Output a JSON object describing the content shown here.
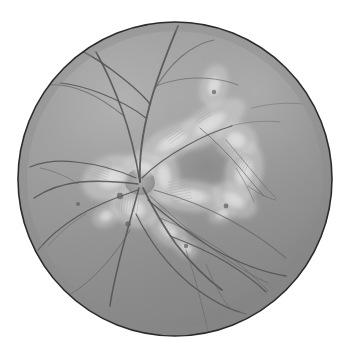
{
  "image": {
    "kind": "fundus-photograph",
    "modality": "Retinal fundus photograph (grayscale)",
    "title": "Retinal fundus photograph",
    "background_color": "#ffffff",
    "width": 349,
    "height": 354
  },
  "fundus": {
    "shape": "circle",
    "center_x": 175,
    "center_y": 179,
    "radius": 157,
    "rim_color": "#2b2b2b",
    "rim_width": 1.6,
    "base_color": "#a6a6a6",
    "highlight_color": "#c4c4c4",
    "shadow_color": "#8d8d8d"
  },
  "optic_disc": {
    "label": "optic-disc",
    "center_x": 140,
    "center_y": 182,
    "radius_x": 15,
    "radius_y": 13,
    "color": "#b0b0b0"
  },
  "vessel_style": {
    "color": "#5b5b5b",
    "color_fine": "#6e6e6e",
    "width_major": 1.7,
    "width_minor": 1.1,
    "width_fine": 0.7
  },
  "exudate_style": {
    "color": "#fbfbfb",
    "soft_color": "#ededed",
    "striation_color": "#bdbdbd"
  },
  "vessels": [
    {
      "name": "superior-temporal-arcade",
      "d": "M140,182 C139,160 143,130 150,104 C157,78 168,50 178,26",
      "w": 1.9
    },
    {
      "name": "superior-branch-a",
      "d": "M150,104 C143,95 128,82 112,70 C97,59 82,50 70,46",
      "w": 1.5
    },
    {
      "name": "superior-branch-b",
      "d": "M146,118 C136,110 118,100 100,93 C84,87 70,84 60,83",
      "w": 1.2
    },
    {
      "name": "superior-branch-c",
      "d": "M153,92 C160,80 170,66 182,56 C192,48 204,42 214,40",
      "w": 1.1
    },
    {
      "name": "superior-branch-d",
      "d": "M156,86 C166,82 182,78 198,78 C214,78 228,81 238,85",
      "w": 0.9
    },
    {
      "name": "superior-nasal-arcade",
      "d": "M140,182 C136,158 130,132 122,110 C114,88 104,66 96,52",
      "w": 1.6
    },
    {
      "name": "superior-nasal-branch",
      "d": "M124,116 C114,108 100,98 86,92 C72,86 58,84 48,85",
      "w": 1.1
    },
    {
      "name": "disc-upper-temporal",
      "d": "M142,178 C152,168 168,156 186,146 C202,137 218,130 232,126",
      "w": 1.2
    },
    {
      "name": "nasal-horizontal",
      "d": "M138,184 C122,182 100,180 80,182 C62,184 46,190 34,198",
      "w": 1.5
    },
    {
      "name": "nasal-upper",
      "d": "M136,178 C118,170 96,164 76,162 C58,160 42,162 30,167",
      "w": 1.2
    },
    {
      "name": "nasal-lower",
      "d": "M138,190 C120,196 98,204 78,216 C62,226 48,238 38,250",
      "w": 1.3
    },
    {
      "name": "inferior-nasal-arcade",
      "d": "M139,188 C134,206 128,228 122,250 C117,270 112,290 110,306",
      "w": 1.5
    },
    {
      "name": "inferior-nasal-branch",
      "d": "M130,230 C122,244 110,260 96,274 C84,286 72,294 62,298",
      "w": 1.0
    },
    {
      "name": "inferior-temporal-arcade",
      "d": "M143,188 C152,206 163,226 176,244 C190,262 206,278 222,290",
      "w": 1.7
    },
    {
      "name": "inferior-temporal-branch-a",
      "d": "M170,236 C186,242 206,250 226,262 C242,272 256,282 266,292",
      "w": 1.2
    },
    {
      "name": "inferior-temporal-branch-b",
      "d": "M160,218 C180,226 204,238 226,254 C244,267 258,280 268,291",
      "w": 0.9
    },
    {
      "name": "inferior-long-sweep",
      "d": "M148,200 C164,214 186,232 212,248 C236,262 262,272 286,276",
      "w": 1.4
    },
    {
      "name": "inferior-sweep-lower",
      "d": "M136,214 C148,238 166,264 190,284 C210,300 230,310 246,314",
      "w": 1.2
    },
    {
      "name": "temporal-mid-a",
      "d": "M154,190 C176,196 204,206 230,220 C252,232 272,246 286,258",
      "w": 1.1
    },
    {
      "name": "temporal-mid-b",
      "d": "M150,196 C168,212 190,232 214,250 C234,265 252,276 268,283",
      "w": 0.9
    },
    {
      "name": "inferior-fine-a",
      "d": "M186,250 C192,268 198,288 202,306 C205,318 207,326 208,332",
      "w": 0.8
    },
    {
      "name": "inferior-fine-b",
      "d": "M206,264 C212,280 220,296 230,308",
      "w": 0.7
    },
    {
      "name": "lesion-vessel-a",
      "d": "M200,128 C214,140 228,154 240,168 C250,180 258,190 264,196",
      "w": 1.0
    },
    {
      "name": "lesion-vessel-b",
      "d": "M226,140 C236,152 248,166 258,178 C266,188 272,194 276,198",
      "w": 0.8
    },
    {
      "name": "lesion-vessel-c",
      "d": "M236,168 C244,180 250,192 254,202",
      "w": 0.7
    },
    {
      "name": "lesion-vessel-d",
      "d": "M248,186 C256,192 266,198 276,200",
      "w": 0.7
    },
    {
      "name": "temporal-fine-upper",
      "d": "M230,126 C246,122 264,120 280,122",
      "w": 0.6
    },
    {
      "name": "far-temporal-fine",
      "d": "M252,108 C268,104 286,102 302,104",
      "w": 0.6
    },
    {
      "name": "nasal-fine-branch",
      "d": "M78,184 C66,176 52,170 40,168",
      "w": 0.7
    },
    {
      "name": "nasal-fine-lower",
      "d": "M86,214 C72,222 58,234 48,246",
      "w": 0.7
    }
  ],
  "exudates": [
    {
      "name": "exudate-peridisc-nasal",
      "cx": 112,
      "cy": 178,
      "rx": 20,
      "ry": 14,
      "rot": -20,
      "opacity": 0.92
    },
    {
      "name": "exudate-peridisc-inferior",
      "cx": 134,
      "cy": 208,
      "rx": 16,
      "ry": 12,
      "rot": 25,
      "opacity": 0.9
    },
    {
      "name": "exudate-disc-margin",
      "cx": 144,
      "cy": 168,
      "rx": 14,
      "ry": 10,
      "rot": 10,
      "opacity": 0.85
    },
    {
      "name": "exudate-band-superior",
      "cx": 172,
      "cy": 142,
      "rx": 24,
      "ry": 10,
      "rot": -28,
      "opacity": 0.88
    },
    {
      "name": "exudate-ring-upper",
      "cx": 210,
      "cy": 124,
      "rx": 26,
      "ry": 11,
      "rot": -32,
      "opacity": 0.9
    },
    {
      "name": "exudate-ring-upper-right",
      "cx": 236,
      "cy": 140,
      "rx": 14,
      "ry": 12,
      "rot": 20,
      "opacity": 0.88
    },
    {
      "name": "exudate-ring-right",
      "cx": 244,
      "cy": 172,
      "rx": 12,
      "ry": 20,
      "rot": 12,
      "opacity": 0.86
    },
    {
      "name": "exudate-ring-lower-right",
      "cx": 234,
      "cy": 200,
      "rx": 16,
      "ry": 10,
      "rot": 30,
      "opacity": 0.8
    },
    {
      "name": "exudate-ring-lower",
      "cx": 190,
      "cy": 196,
      "rx": 26,
      "ry": 10,
      "rot": 6,
      "opacity": 0.84
    },
    {
      "name": "exudate-ring-left",
      "cx": 164,
      "cy": 176,
      "rx": 10,
      "ry": 18,
      "rot": -6,
      "opacity": 0.8
    },
    {
      "name": "exudate-loop-superior",
      "cx": 214,
      "cy": 86,
      "rx": 9,
      "ry": 14,
      "rot": 14,
      "opacity": 0.82
    },
    {
      "name": "exudate-inferior-tail",
      "cx": 168,
      "cy": 230,
      "rx": 14,
      "ry": 9,
      "rot": 40,
      "opacity": 0.78
    },
    {
      "name": "exudate-inferior-spot",
      "cx": 186,
      "cy": 248,
      "rx": 8,
      "ry": 6,
      "rot": 35,
      "opacity": 0.72
    },
    {
      "name": "exudate-nasal-tail",
      "cx": 106,
      "cy": 216,
      "rx": 9,
      "ry": 7,
      "rot": -25,
      "opacity": 0.74
    },
    {
      "name": "exudate-temporal-spot",
      "cx": 222,
      "cy": 214,
      "rx": 9,
      "ry": 6,
      "rot": -20,
      "opacity": 0.7
    }
  ],
  "striation_groups": [
    {
      "name": "striae-nasal-disc",
      "x": 100,
      "y": 168,
      "count": 8,
      "len": 20,
      "rot": -72,
      "spacing": 2.6
    },
    {
      "name": "striae-inferior-disc",
      "x": 128,
      "y": 200,
      "count": 9,
      "len": 22,
      "rot": 8,
      "spacing": 2.6
    },
    {
      "name": "striae-superior-band",
      "x": 172,
      "y": 130,
      "count": 8,
      "len": 18,
      "rot": 54,
      "spacing": 2.8
    },
    {
      "name": "striae-ring-upper",
      "x": 200,
      "y": 112,
      "count": 7,
      "len": 16,
      "rot": 58,
      "spacing": 2.8
    },
    {
      "name": "striae-ring-right",
      "x": 240,
      "y": 160,
      "count": 8,
      "len": 18,
      "rot": 26,
      "spacing": 2.6
    },
    {
      "name": "striae-ring-lower",
      "x": 180,
      "y": 190,
      "count": 8,
      "len": 20,
      "rot": 80,
      "spacing": 2.8
    },
    {
      "name": "striae-inferior-tail",
      "x": 164,
      "y": 226,
      "count": 6,
      "len": 14,
      "rot": 52,
      "spacing": 2.6
    }
  ],
  "dark_spots": [
    {
      "name": "hemorrhage-nasal",
      "cx": 120,
      "cy": 196,
      "r": 3.2
    },
    {
      "name": "hemorrhage-inferior-disc",
      "cx": 128,
      "cy": 224,
      "r": 2.8
    },
    {
      "name": "hemorrhage-temporal",
      "cx": 226,
      "cy": 206,
      "r": 2.4
    },
    {
      "name": "hemorrhage-inferior",
      "cx": 186,
      "cy": 246,
      "r": 2.2
    },
    {
      "name": "hemorrhage-nasal-mid",
      "cx": 78,
      "cy": 204,
      "r": 2.0
    },
    {
      "name": "hemorrhage-superior",
      "cx": 214,
      "cy": 92,
      "r": 2.2
    }
  ]
}
